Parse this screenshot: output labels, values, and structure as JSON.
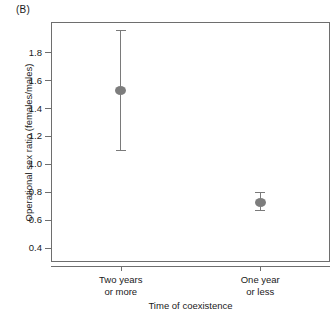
{
  "figure": {
    "panel_label": "(B)"
  },
  "chart_data": {
    "type": "scatter",
    "title": "",
    "subtitle": "",
    "xlabel": "Time of coexistence",
    "ylabel": "Operational sex ratio (females/males)",
    "categories": [
      "Two years or more",
      "One year or less"
    ],
    "category_lines": [
      [
        "Two years",
        "or more"
      ],
      [
        "One year",
        "or less"
      ]
    ],
    "x": [
      1,
      2
    ],
    "values": [
      1.53,
      0.73
    ],
    "error_low": [
      1.1,
      0.67
    ],
    "error_high": [
      1.96,
      0.8
    ],
    "error_minus": [
      0.43,
      0.06
    ],
    "error_plus": [
      0.43,
      0.07
    ],
    "ylim": [
      0.3,
      2.02
    ],
    "xlim": [
      0.5,
      2.5
    ],
    "yticks": [
      0.4,
      0.6,
      0.8,
      1.0,
      1.2,
      1.4,
      1.6,
      1.8
    ],
    "ytick_labels": [
      "0.4",
      "0.6",
      "0.8",
      "1.0",
      "1.2",
      "1.4",
      "1.6",
      "1.8"
    ],
    "grid": false,
    "legend": null,
    "marker_color": "#7d7d7d",
    "errorbar_color": "#7a7a7a",
    "axis_color": "#6e6e6e",
    "background": "#ffffff"
  }
}
